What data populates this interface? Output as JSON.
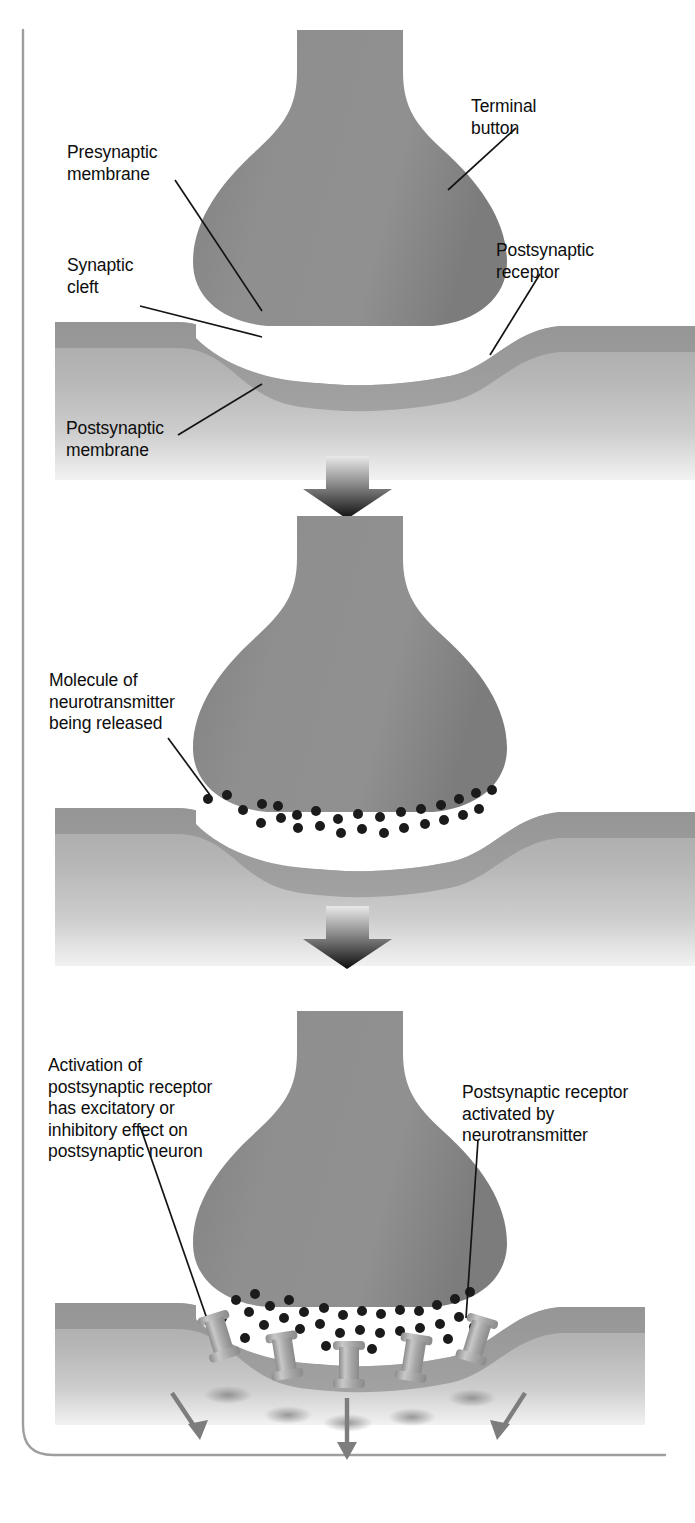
{
  "figure": {
    "type": "biological-process-diagram",
    "panel_count": 3,
    "colors": {
      "terminal_button": "#8e8e8e",
      "postsynaptic_cell_band": "#9a9a9a",
      "postsynaptic_cell_body": "#b4b4b4",
      "synaptic_cleft": "#ffffff",
      "neurotransmitter_dot": "#1b1b1b",
      "receptor": "#a9a9a9",
      "effect_arrow": "#7d7d7d",
      "leader_line": "#141414",
      "transition_arrow": "#121212",
      "border_line": "#9b9b9b",
      "text": "#0d0d0d"
    }
  },
  "panels": [
    {
      "id": "panel-1",
      "name": "resting-synapse",
      "labels": [
        {
          "id": "terminal-button",
          "text": "Terminal\nbutton"
        },
        {
          "id": "presynaptic-membrane",
          "text": "Presynaptic\nmembrane"
        },
        {
          "id": "synaptic-cleft",
          "text": "Synaptic\ncleft"
        },
        {
          "id": "postsynaptic-receptor",
          "text": "Postsynaptic\nreceptor"
        },
        {
          "id": "postsynaptic-membrane",
          "text": "Postsynaptic\nmembrane"
        }
      ]
    },
    {
      "id": "panel-2",
      "name": "neurotransmitter-release",
      "labels": [
        {
          "id": "molecule-of-neurotransmitter",
          "text": "Molecule of\nneurotransmitter\nbeing released"
        }
      ],
      "neurotransmitter_count": 28
    },
    {
      "id": "panel-3",
      "name": "receptor-activation",
      "labels": [
        {
          "id": "activation-effect",
          "text": "Activation of\npostsynaptic receptor\nhas excitatory or\ninhibitory effect on\npostsynaptic neuron"
        },
        {
          "id": "receptor-activated",
          "text": "Postsynaptic receptor\nactivated by\nneurotransmitter"
        }
      ],
      "receptor_count": 5,
      "effect_arrow_count": 3,
      "neurotransmitter_count": 34
    }
  ],
  "transition_arrows": [
    {
      "id": "arrow-1-to-2",
      "direction": "down"
    },
    {
      "id": "arrow-2-to-3",
      "direction": "down"
    }
  ]
}
